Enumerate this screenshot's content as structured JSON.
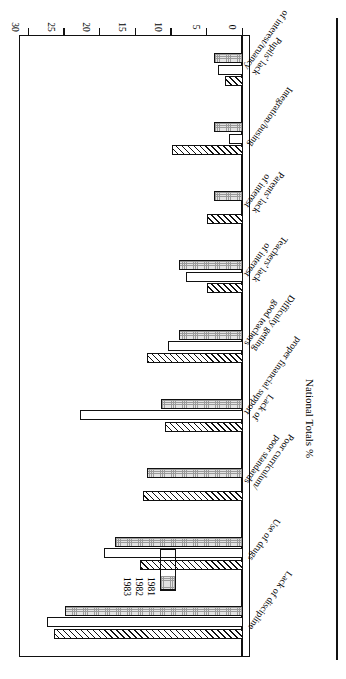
{
  "chart_data": {
    "type": "bar",
    "orientation": "horizontal",
    "title": "",
    "xlabel": "",
    "ylabel": "National Totals %",
    "axis_title": "National Totals %",
    "ylim": [
      0,
      30
    ],
    "grid": false,
    "legend_position": "upper-left-inside",
    "tick_labels": [
      "0",
      "5",
      "10",
      "15",
      "20",
      "25",
      "30"
    ],
    "tick_values": [
      0,
      5,
      10,
      15,
      20,
      25,
      30
    ],
    "categories": [
      "Lack of discipline",
      "Use of drugs",
      "Poor curriculum/ poor standards",
      "Lack of proper financial support",
      "Difficulty getting good teachers",
      "Teachers' lack of interest",
      "Parents' lack of interest",
      "Integration/busing",
      "Pupils' lack of interest/truancy"
    ],
    "series": [
      {
        "name": "1981",
        "pattern": "diagonal-hatch",
        "values": [
          26.5,
          14.5,
          14.0,
          11.0,
          13.5,
          5.0,
          5.0,
          10.0,
          2.5
        ]
      },
      {
        "name": "1982",
        "pattern": "white",
        "values": [
          27.5,
          19.5,
          0.2,
          22.8,
          10.5,
          8.0,
          0.3,
          2.0,
          3.5
        ]
      },
      {
        "name": "1983",
        "pattern": "stipple",
        "values": [
          25.0,
          18.0,
          13.5,
          11.5,
          9.0,
          9.0,
          4.0,
          4.0,
          4.0
        ]
      }
    ],
    "legend_entries": [
      {
        "label": "1981",
        "pattern": "diagonal-hatch"
      },
      {
        "label": "1982",
        "pattern": "white"
      },
      {
        "label": "1983",
        "pattern": "stipple"
      }
    ],
    "colors": {
      "line": "#111111",
      "fill_1981": "#ffffff",
      "fill_1982": "#ffffff",
      "fill_1983": "#e3e3e3",
      "background": "#ffffff"
    }
  }
}
